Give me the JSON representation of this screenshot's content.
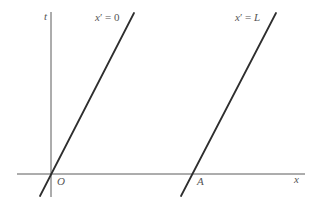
{
  "diagram": {
    "title": "",
    "axes": {
      "vertical_label": "t",
      "horizontal_label": "x"
    },
    "points": {
      "origin_label": "O",
      "point_a_label": "A"
    },
    "worldlines": [
      {
        "var": "x",
        "prime": "′",
        "eq": " = ",
        "value": "0"
      },
      {
        "var": "x",
        "prime": "′",
        "eq": " = ",
        "value": "L"
      }
    ],
    "colors": {
      "axis": "#5a5a5a",
      "worldline": "#2e2e2e",
      "label": "#555555",
      "background": "#ffffff"
    }
  }
}
